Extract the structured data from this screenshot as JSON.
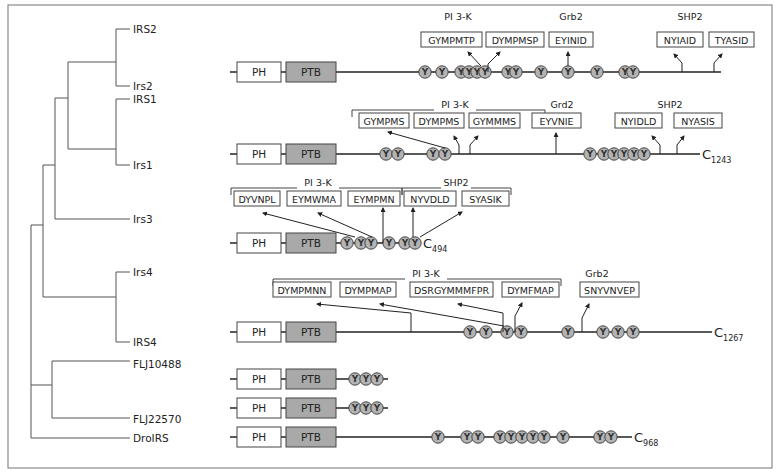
{
  "figure": {
    "colors": {
      "frame": "#8a8a8a",
      "ptb_fill": "#a9a9a9",
      "tyr_fill": "#b3b3b3",
      "line": "#222222"
    },
    "domain_labels": {
      "ph": "PH",
      "ptb": "PTB",
      "tyrosine": "Y"
    }
  },
  "tree": {
    "leaves": [
      {
        "label": "IRS2",
        "x": 130,
        "y": 29
      },
      {
        "label": "Irs2",
        "x": 130,
        "y": 86
      },
      {
        "label": "IRS1",
        "x": 130,
        "y": 99
      },
      {
        "label": "Irs1",
        "x": 130,
        "y": 165
      },
      {
        "label": "Irs3",
        "x": 130,
        "y": 219
      },
      {
        "label": "Irs4",
        "x": 130,
        "y": 272
      },
      {
        "label": "IRS4",
        "x": 130,
        "y": 342
      },
      {
        "label": "FLJ10488",
        "x": 130,
        "y": 364
      },
      {
        "label": "FLJ22570",
        "x": 130,
        "y": 419
      },
      {
        "label": "DroIRS",
        "x": 130,
        "y": 438
      }
    ]
  },
  "proteins": [
    {
      "name": "IRS2/Irs2",
      "y": 72,
      "line_end": 721,
      "c_term": null,
      "tyrosines": [
        425,
        442,
        461,
        469,
        477,
        485,
        508,
        516,
        541,
        568,
        597,
        625,
        633
      ],
      "groups": [
        {
          "label": "PI 3-K",
          "x": 458,
          "y": 18,
          "bracket": null
        },
        {
          "label": "Grb2",
          "x": 571,
          "y": 18,
          "bracket": null
        },
        {
          "label": "SHP2",
          "x": 690,
          "y": 18,
          "bracket": null
        }
      ],
      "motifs": [
        {
          "text": "GYMPMTP",
          "x": 421,
          "w": 61
        },
        {
          "text": "DYMPMSP",
          "x": 486,
          "w": 58
        },
        {
          "text": "EYINID",
          "x": 549,
          "w": 44
        },
        {
          "text": "NYIAID",
          "x": 657,
          "w": 46
        },
        {
          "text": "TYASID",
          "x": 709,
          "w": 45
        }
      ],
      "motif_y": 40
    },
    {
      "name": "IRS1/Irs1",
      "y": 154,
      "line_end": 700,
      "c_term": {
        "letter": "C",
        "num": "1243"
      },
      "tyrosines": [
        386,
        398,
        433,
        445,
        590,
        604,
        614,
        624,
        634,
        644
      ],
      "groups": [
        {
          "label": "PI 3-K",
          "x": 455,
          "y": 106,
          "bracket": [
            352,
            545,
            110,
            117
          ]
        },
        {
          "label": "Grd2",
          "x": 562,
          "y": 106,
          "bracket": null
        },
        {
          "label": "SHP2",
          "x": 670,
          "y": 106,
          "bracket": null
        }
      ],
      "motifs": [
        {
          "text": "GYMPMS",
          "x": 359,
          "w": 50
        },
        {
          "text": "DYMPMS",
          "x": 414,
          "w": 50
        },
        {
          "text": "GYMMMS",
          "x": 469,
          "w": 51
        },
        {
          "text": "EYVNIE",
          "x": 532,
          "w": 49
        },
        {
          "text": "NYIDLD",
          "x": 615,
          "w": 47
        },
        {
          "text": "NYASIS",
          "x": 674,
          "w": 48
        }
      ],
      "motif_y": 121
    },
    {
      "name": "Irs3",
      "y": 243,
      "line_end": 421,
      "c_term": {
        "letter": "C",
        "num": "494"
      },
      "tyrosines": [
        347,
        361,
        371,
        389,
        405,
        415
      ],
      "groups": [
        {
          "label": "PI 3-K",
          "x": 318,
          "y": 184,
          "bracket": [
            231,
            402,
            188,
            195
          ]
        },
        {
          "label": "SHP2",
          "x": 456,
          "y": 184,
          "bracket": [
            402,
            511,
            188,
            195
          ]
        }
      ],
      "motifs": [
        {
          "text": "DYVNPL",
          "x": 234,
          "w": 46
        },
        {
          "text": "EYMWMA",
          "x": 287,
          "w": 54
        },
        {
          "text": "EYMPMN",
          "x": 348,
          "w": 52
        },
        {
          "text": "NYVDLD",
          "x": 404,
          "w": 52
        },
        {
          "text": "SYASIK",
          "x": 462,
          "w": 47
        }
      ],
      "motif_y": 199
    },
    {
      "name": "Irs4/IRS4",
      "y": 332,
      "line_end": 712,
      "c_term": {
        "letter": "C",
        "num": "1267"
      },
      "tyrosines": [
        470,
        486,
        507,
        521,
        568,
        603,
        618,
        633
      ],
      "groups": [
        {
          "label": "PI 3-K",
          "x": 426,
          "y": 275,
          "bracket": [
            273,
            561,
            279,
            286
          ]
        },
        {
          "label": "Grb2",
          "x": 597,
          "y": 275,
          "bracket": null
        }
      ],
      "motifs": [
        {
          "text": "DYMPMNN",
          "x": 273,
          "w": 58
        },
        {
          "text": "DYMPMAP",
          "x": 340,
          "w": 56
        },
        {
          "text": "DSRGYMMMFPR",
          "x": 410,
          "w": 83
        },
        {
          "text": "DYMFMAP",
          "x": 502,
          "w": 57
        },
        {
          "text": "SNYVNVEP",
          "x": 580,
          "w": 59
        }
      ],
      "motif_y": 290
    },
    {
      "name": "FLJ10488",
      "y": 379,
      "line_end": 388,
      "c_term": null,
      "tyrosines": [
        355,
        366,
        377
      ],
      "groups": [],
      "motifs": []
    },
    {
      "name": "FLJ22570",
      "y": 408,
      "line_end": 388,
      "c_term": null,
      "tyrosines": [
        355,
        366,
        377
      ],
      "groups": [],
      "motifs": []
    },
    {
      "name": "DroIRS",
      "y": 437,
      "line_end": 632,
      "c_term": {
        "letter": "C",
        "num": "968"
      },
      "tyrosines": [
        438,
        467,
        478,
        500,
        511,
        522,
        533,
        544,
        563,
        600,
        611
      ],
      "groups": [],
      "motifs": []
    }
  ]
}
